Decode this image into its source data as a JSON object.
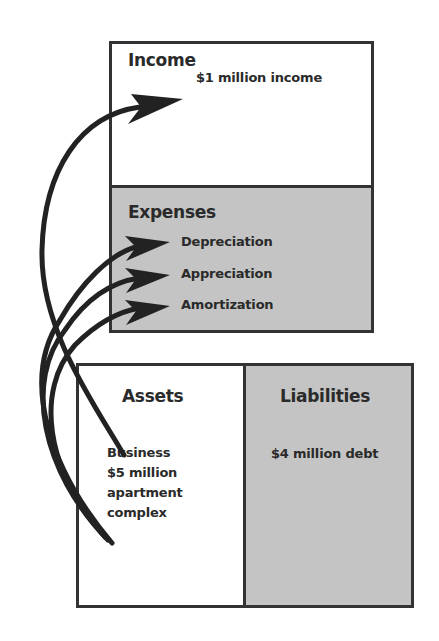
{
  "diagram": {
    "income": {
      "title": "Income",
      "items": [
        "$1 million income"
      ]
    },
    "expenses": {
      "title": "Expenses",
      "items": [
        "Depreciation",
        "Appreciation",
        "Amortization"
      ]
    },
    "assets": {
      "title": "Assets",
      "lines": [
        "Business",
        "$5 million",
        "apartment",
        "complex"
      ]
    },
    "liabilities": {
      "title": "Liabilities",
      "items": [
        "$4 million debt"
      ]
    }
  },
  "colors": {
    "border": "#333333",
    "shaded_fill": "#c4c4c4",
    "white_fill": "#ffffff",
    "arrow": "#222222"
  },
  "arrows": [
    {
      "from": "assets",
      "to": "income.items.0"
    },
    {
      "from": "assets",
      "to": "expenses.items.0"
    },
    {
      "from": "assets",
      "to": "expenses.items.1"
    },
    {
      "from": "assets",
      "to": "expenses.items.2"
    }
  ]
}
